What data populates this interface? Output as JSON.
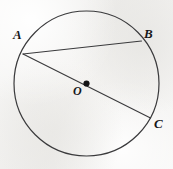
{
  "figure": {
    "kind": "circle-geometry-diagram",
    "canvas": {
      "width": 173,
      "height": 169
    },
    "background_color": "#f2f1ef",
    "stroke_color": "#3a3a3c",
    "label_color": "#18181a"
  },
  "chart_data": {
    "type": "scatter",
    "title": "",
    "xlabel": "",
    "ylabel": "",
    "grid": false,
    "legend": null,
    "xlim": [
      0,
      173
    ],
    "ylim": [
      0,
      169
    ],
    "shapes": [
      {
        "name": "circle-O",
        "type": "circle",
        "cx": 86.5,
        "cy": 83.5,
        "r": 72.5,
        "stroke": "#3a3a3c",
        "stroke_width": 1.2,
        "fill": "none"
      },
      {
        "name": "chord-AB",
        "type": "segment",
        "from": "A",
        "to": "B",
        "x1": 23,
        "y1": 54,
        "x2": 141.5,
        "y2": 41,
        "stroke": "#3a3a3c",
        "stroke_width": 1.1
      },
      {
        "name": "diameter-AC",
        "type": "segment",
        "from": "A",
        "to": "C",
        "x1": 23,
        "y1": 54,
        "x2": 150.5,
        "y2": 118,
        "stroke": "#3a3a3c",
        "stroke_width": 1.1,
        "passes_through": "O"
      },
      {
        "name": "center-dot-O",
        "type": "dot",
        "cx": 86.5,
        "cy": 83.5,
        "r": 3.1,
        "fill": "#151517"
      }
    ],
    "points": [
      {
        "id": "A",
        "label": "A",
        "x": 23,
        "y": 54,
        "on": "circle",
        "label_x": 13,
        "label_y": 28
      },
      {
        "id": "B",
        "label": "B",
        "x": 141.5,
        "y": 41,
        "on": "circle",
        "label_x": 144,
        "label_y": 27
      },
      {
        "id": "C",
        "label": "C",
        "x": 150.5,
        "y": 118,
        "on": "circle",
        "label_x": 154,
        "label_y": 117
      },
      {
        "id": "O",
        "label": "O",
        "x": 86.5,
        "y": 83.5,
        "on": "center",
        "label_x": 73,
        "label_y": 85
      }
    ]
  }
}
